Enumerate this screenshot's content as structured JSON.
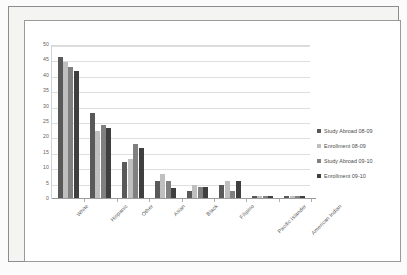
{
  "chart_data": {
    "type": "bar",
    "title": "",
    "subtitle": "",
    "xlabel": "",
    "ylabel": "",
    "ylim": [
      0,
      50
    ],
    "grid": true,
    "legend_position": "right",
    "y_ticks": [
      "0",
      "5",
      "10",
      "15",
      "20",
      "25",
      "30",
      "35",
      "40",
      "45",
      "50"
    ],
    "categories": [
      "White",
      "Hispanic",
      "Other",
      "Asian",
      "Black",
      "Filipino",
      "Pacific Islander",
      "American Indian"
    ],
    "series": [
      {
        "name": "Study Abroad 08-09",
        "color": "#595959",
        "values": [
          46,
          28,
          12,
          6,
          2.5,
          4.5,
          1,
          1
        ]
      },
      {
        "name": "Enrollment 08-09",
        "color": "#bfbfbf",
        "values": [
          44.5,
          22,
          13,
          8,
          4.5,
          6,
          1,
          1
        ]
      },
      {
        "name": "Study Abroad 09-10",
        "color": "#808080",
        "values": [
          43,
          24,
          18,
          6,
          4,
          2.5,
          1,
          1
        ]
      },
      {
        "name": "Enrollment 09-10",
        "color": "#3f3f3f",
        "values": [
          41.5,
          23,
          16.5,
          3.5,
          4,
          6,
          1,
          1
        ]
      }
    ]
  },
  "legend": {
    "items": [
      {
        "label": "Study Abroad 08-09",
        "color": "#595959"
      },
      {
        "label": "Enrollment 08-09",
        "color": "#bfbfbf"
      },
      {
        "label": "Study Abroad 09-10",
        "color": "#808080"
      },
      {
        "label": "Enrollment 09-10",
        "color": "#3f3f3f"
      }
    ]
  },
  "colors": {
    "page_background": "#fbfbfb",
    "frame_background": "#f4f4f2",
    "chart_background": "#ffffff",
    "gridline": "#dedede",
    "axis_line": "#9c9c9c",
    "tick_label": "#5f5f5f"
  }
}
